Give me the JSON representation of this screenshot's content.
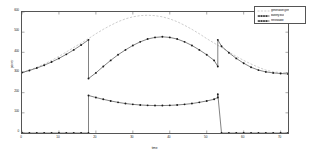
{
  "chart_data": {
    "type": "line",
    "title": "",
    "xlabel": "time",
    "ylabel": "power",
    "xlim": [
      0,
      72
    ],
    "ylim": [
      0,
      600
    ],
    "grid": false,
    "legend_position": "top-right",
    "xticks": [
      0,
      10,
      20,
      30,
      40,
      50,
      60,
      70
    ],
    "yticks": [
      0,
      100,
      200,
      300,
      400,
      500,
      600
    ],
    "xtick_labels": [
      "0",
      "10",
      "20",
      "30",
      "40",
      "50",
      "60",
      "70"
    ],
    "ytick_labels": [
      "0",
      "100",
      "200",
      "300",
      "400",
      "500",
      "600"
    ],
    "series": [
      {
        "name": "generation gen",
        "style": "dashed",
        "color": "#b8b8b8",
        "marker": "none",
        "x": [
          0,
          2,
          4,
          6,
          8,
          10,
          12,
          14,
          16,
          18,
          20,
          22,
          24,
          26,
          28,
          30,
          32,
          34,
          36,
          38,
          40,
          42,
          44,
          46,
          48,
          50,
          52,
          54,
          56,
          58,
          60,
          62,
          64,
          66,
          68,
          70,
          72
        ],
        "y": [
          300,
          312,
          326,
          342,
          360,
          380,
          402,
          424,
          446,
          468,
          492,
          514,
          534,
          552,
          566,
          576,
          582,
          584,
          582,
          576,
          566,
          552,
          534,
          514,
          492,
          468,
          446,
          424,
          402,
          380,
          360,
          342,
          326,
          312,
          303,
          300,
          298
        ]
      },
      {
        "name": "battery bus",
        "style": "solid-dotted",
        "color": "#1a1a1a",
        "marker": "dot",
        "x": [
          0,
          2,
          4,
          6,
          8,
          10,
          12,
          14,
          16,
          18,
          18,
          20,
          22,
          24,
          26,
          28,
          30,
          32,
          34,
          36,
          38,
          40,
          42,
          44,
          46,
          48,
          50,
          52,
          53,
          53,
          54,
          56,
          58,
          60,
          62,
          64,
          66,
          68,
          70,
          72
        ],
        "y": [
          300,
          310,
          322,
          336,
          352,
          370,
          390,
          412,
          436,
          462,
          270,
          298,
          330,
          360,
          388,
          412,
          434,
          452,
          466,
          474,
          477,
          474,
          466,
          452,
          434,
          412,
          388,
          360,
          330,
          462,
          430,
          398,
          370,
          346,
          326,
          312,
          303,
          298,
          295,
          293
        ]
      },
      {
        "name": "renewable",
        "style": "solid-dotted",
        "color": "#1a1a1a",
        "marker": "dot",
        "x": [
          0,
          2,
          4,
          6,
          8,
          10,
          12,
          14,
          16,
          18,
          18,
          20,
          22,
          24,
          26,
          28,
          30,
          32,
          34,
          36,
          38,
          40,
          42,
          44,
          46,
          48,
          50,
          52,
          53,
          53,
          54,
          56,
          58,
          60,
          62,
          64,
          66,
          68,
          70,
          72
        ],
        "y": [
          0,
          0,
          0,
          0,
          0,
          0,
          0,
          0,
          0,
          0,
          186,
          176,
          167,
          159,
          152,
          146,
          142,
          139,
          137,
          136,
          136,
          137,
          139,
          142,
          146,
          152,
          159,
          167,
          176,
          192,
          0,
          0,
          0,
          0,
          0,
          0,
          0,
          0,
          0,
          0
        ]
      }
    ]
  }
}
